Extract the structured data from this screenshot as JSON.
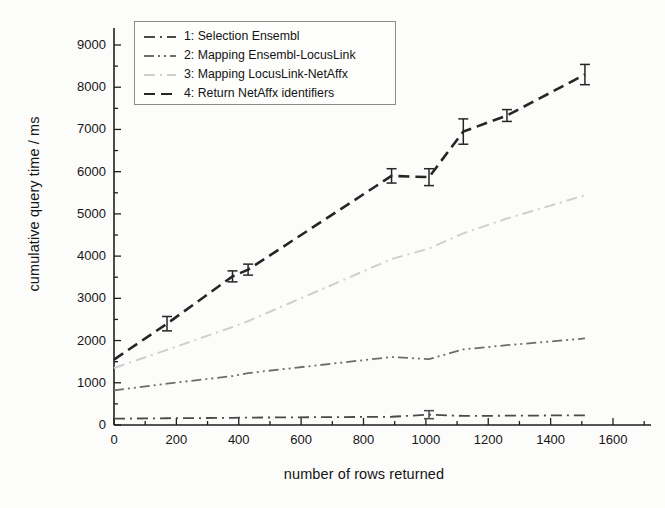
{
  "chart_data": {
    "type": "line",
    "title": "",
    "xlabel": "number of rows returned",
    "ylabel": "cumulative query time / ms",
    "xlim": [
      -40,
      1660
    ],
    "ylim": [
      -120,
      9450
    ],
    "xticks": [
      0,
      200,
      400,
      600,
      800,
      1000,
      1200,
      1400,
      1600
    ],
    "yticks": [
      0,
      1000,
      2000,
      3000,
      4000,
      5000,
      6000,
      7000,
      8000,
      9000
    ],
    "xminor_step": 100,
    "yminor_step": 500,
    "grid": false,
    "legend_position": "upper left",
    "series": [
      {
        "name": "1: Selection Ensembl",
        "label": "1: Selection Ensembl",
        "color": "#4a4a4a",
        "dash": "dashdot",
        "x": [
          0,
          170,
          380,
          430,
          890,
          1010,
          1120,
          1260,
          1510
        ],
        "y": [
          150,
          160,
          170,
          175,
          195,
          245,
          215,
          220,
          230
        ],
        "yerr": [
          0,
          0,
          0,
          0,
          0,
          95,
          0,
          0,
          0
        ]
      },
      {
        "name": "2: Mapping Ensembl-LocusLink",
        "label": "2: Mapping Ensembl-LocusLink",
        "color": "#6d6d6d",
        "dash": "dashdotdot",
        "x": [
          0,
          170,
          380,
          430,
          890,
          1010,
          1120,
          1260,
          1510
        ],
        "y": [
          820,
          980,
          1160,
          1230,
          1610,
          1560,
          1790,
          1890,
          2050
        ],
        "yerr": [
          0,
          0,
          0,
          0,
          0,
          0,
          0,
          0,
          0
        ]
      },
      {
        "name": "3: Mapping LocusLink-NetAffx",
        "label": "3: Mapping LocusLink-NetAffx",
        "color": "#cfcfcf",
        "dash": "dashdot",
        "x": [
          0,
          170,
          380,
          430,
          890,
          1010,
          1120,
          1260,
          1510
        ],
        "y": [
          1350,
          1780,
          2320,
          2460,
          3930,
          4180,
          4540,
          4890,
          5440
        ],
        "yerr": [
          0,
          0,
          0,
          0,
          0,
          0,
          0,
          0,
          0
        ]
      },
      {
        "name": "4: Return NetAffx identifiers",
        "label": "4: Return NetAffx identifiers",
        "color": "#262626",
        "dash": "dashed",
        "x": [
          0,
          170,
          380,
          430,
          890,
          1010,
          1120,
          1260,
          1510
        ],
        "y": [
          1550,
          2400,
          3520,
          3680,
          5900,
          5870,
          6950,
          7330,
          8300
        ],
        "yerr": [
          0,
          170,
          130,
          130,
          170,
          200,
          300,
          140,
          240
        ]
      }
    ]
  }
}
